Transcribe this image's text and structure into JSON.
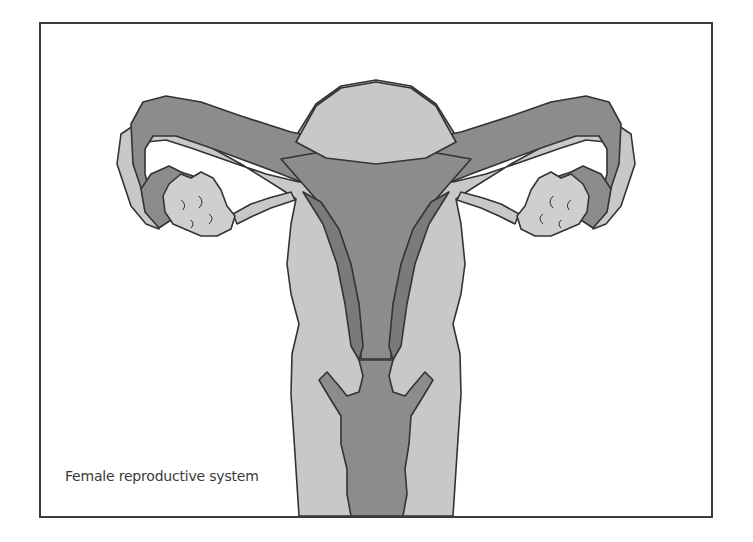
{
  "figure": {
    "caption": "Female reproductive system",
    "colors": {
      "background": "#ffffff",
      "frame_border": "#3a3a3a",
      "outline": "#333333",
      "light_tissue": "#c8c8c8",
      "dark_tissue": "#8c8c8c",
      "inner_lining": "#7a7a7a",
      "ovary": "#cfcfcf",
      "caption_text": "#3a3a3a"
    },
    "structures": [
      "uterus-fundus",
      "uterine-cavity",
      "endometrium-lining",
      "fallopian-tube-left",
      "fallopian-tube-right",
      "fimbriae-left",
      "fimbriae-right",
      "ovary-left",
      "ovary-right",
      "ovarian-ligament-left",
      "ovarian-ligament-right",
      "cervix",
      "vagina"
    ]
  }
}
